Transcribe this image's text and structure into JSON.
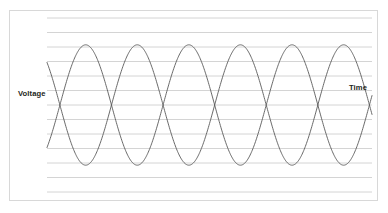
{
  "figure": {
    "title": "",
    "frame": {
      "border_color": "#d8d8d8",
      "background": "#ffffff"
    },
    "labels": {
      "y_axis": "Voltage",
      "x_axis": "Time"
    }
  },
  "chart_data": {
    "type": "line",
    "title": "",
    "xlabel": "Time",
    "ylabel": "Voltage",
    "grid": true,
    "grid_orientation": "horizontal",
    "grid_line_count": 13,
    "grid_color": "#c9c9c9",
    "legend": "none",
    "axis_ticks_shown": false,
    "xlim": [
      0,
      3.15
    ],
    "ylim": [
      -1.25,
      1.25
    ],
    "x_unit": "cycles",
    "series": [
      {
        "name": "wave-a",
        "color": "#595959",
        "waveform": "sine",
        "amplitude": 1,
        "cycles": 3,
        "phase_deg": 135,
        "linewidth": 0.9
      },
      {
        "name": "wave-b",
        "color": "#595959",
        "waveform": "sine",
        "amplitude": 1,
        "cycles": 3,
        "phase_deg": 315,
        "linewidth": 0.9
      }
    ],
    "annotations": [
      {
        "text": "Voltage",
        "position": "left-middle",
        "bold": true
      },
      {
        "text": "Time",
        "position": "right-upper",
        "bold": true
      }
    ]
  }
}
